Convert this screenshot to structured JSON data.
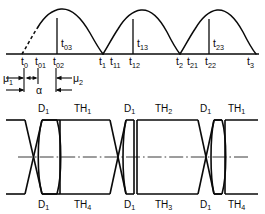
{
  "figure": {
    "background_color": "#ffffff",
    "line_color": "#0a0a0a"
  },
  "upper_plot": {
    "description": "Three rectified sinusoidal half-wave arches on a horizontal time axis with firing-instant vertical markers",
    "type": "waveform",
    "arch_count": 3,
    "leading_edge_style": "dashed",
    "axis_label": "t",
    "firing_markers": [
      {
        "label": "t",
        "subscript": "03",
        "x": 60,
        "position": "above-axis"
      },
      {
        "label": "t",
        "subscript": "13",
        "x": 136,
        "position": "above-axis"
      },
      {
        "label": "t",
        "subscript": "23",
        "x": 208,
        "position": "above-axis"
      }
    ],
    "axis_ticks": [
      {
        "label": "t",
        "subscript": "0"
      },
      {
        "label": "t",
        "subscript": "01"
      },
      {
        "label": "t",
        "subscript": "02"
      },
      {
        "label": "t",
        "subscript": "1"
      },
      {
        "label": "t",
        "subscript": "11"
      },
      {
        "label": "t",
        "subscript": "12"
      },
      {
        "label": "t",
        "subscript": "2"
      },
      {
        "label": "t",
        "subscript": "21"
      },
      {
        "label": "t",
        "subscript": "22"
      },
      {
        "label": "t",
        "subscript": "3"
      }
    ]
  },
  "dimension_annotations": {
    "mu1": {
      "label": "μ",
      "subscript": "1",
      "arrow": "right"
    },
    "mu2": {
      "label": "μ",
      "subscript": "2",
      "arrow": "left"
    },
    "alpha": {
      "label": "α",
      "arrow": "double"
    }
  },
  "lower_plot": {
    "description": "Conduction interval bands with bow-tie commutation crossings",
    "type": "timing-diagram",
    "centerline_style": "dash-dot",
    "top_labels": [
      {
        "label": "D",
        "subscript": "1",
        "center_x": 44
      },
      {
        "label": "TH",
        "subscript": "1",
        "center_x": 89
      },
      {
        "label": "D",
        "subscript": "1",
        "center_x": 131
      },
      {
        "label": "TH",
        "subscript": "2",
        "center_x": 170
      },
      {
        "label": "D",
        "subscript": "1",
        "center_x": 207
      },
      {
        "label": "TH",
        "subscript": "1",
        "center_x": 240
      }
    ],
    "bottom_labels": [
      {
        "label": "D",
        "subscript": "1",
        "center_x": 44
      },
      {
        "label": "TH",
        "subscript": "4",
        "center_x": 89
      },
      {
        "label": "D",
        "subscript": "1",
        "center_x": 131
      },
      {
        "label": "TH",
        "subscript": "3",
        "center_x": 170
      },
      {
        "label": "D",
        "subscript": "1",
        "center_x": 207
      },
      {
        "label": "TH",
        "subscript": "4",
        "center_x": 240
      }
    ]
  }
}
